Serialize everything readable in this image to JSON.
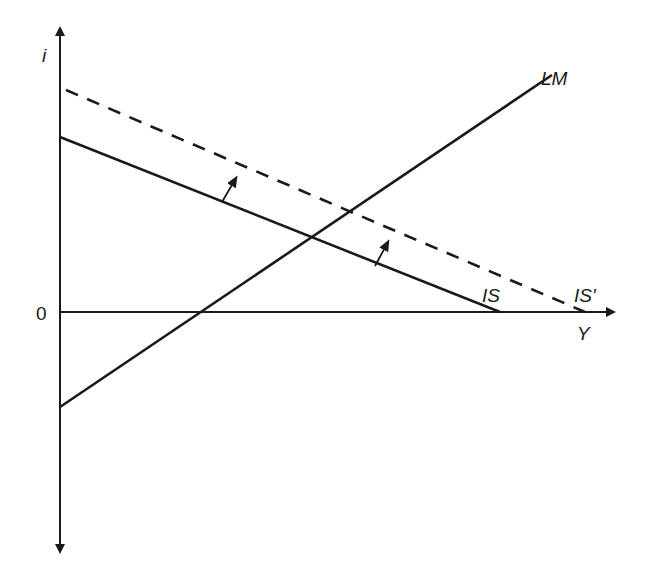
{
  "diagram": {
    "axes": {
      "y_label": "i",
      "x_label": "Y",
      "origin_label": "0"
    },
    "curves": {
      "is": {
        "label": "IS",
        "style": "solid"
      },
      "is_prime": {
        "label": "IS'",
        "style": "dashed"
      },
      "lm": {
        "label": "LM",
        "style": "solid"
      }
    },
    "shift_arrows": {
      "count": 2,
      "direction": "upward-right (IS to IS')"
    },
    "colors": {
      "line": "#1a1a1a",
      "background": "#ffffff"
    }
  }
}
